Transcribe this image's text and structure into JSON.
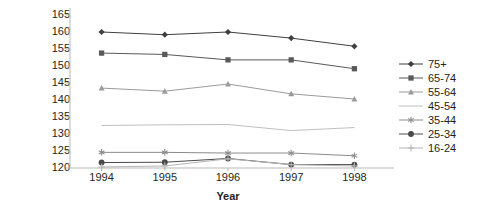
{
  "chart_data": {
    "type": "line",
    "title": "",
    "xlabel": "Year",
    "ylabel": "Systolic BP",
    "x": [
      1994,
      1995,
      1996,
      1997,
      1998
    ],
    "xtick_labels": [
      "1994",
      "1995",
      "1996",
      "1997",
      "1998"
    ],
    "ytick_labels": [
      "120",
      "125",
      "130",
      "135",
      "140",
      "145",
      "150",
      "155",
      "160",
      "165"
    ],
    "ylim": [
      120,
      165
    ],
    "ytick_step": 5,
    "grid": false,
    "legend_position": "right",
    "series": [
      {
        "name": "75+",
        "marker": "diamond",
        "color": "#3f3f3f",
        "values": [
          160.0,
          159.2,
          160.0,
          158.2,
          155.8
        ]
      },
      {
        "name": "65-74",
        "marker": "square",
        "color": "#595959",
        "values": [
          153.8,
          153.4,
          151.8,
          151.8,
          149.2
        ]
      },
      {
        "name": "55-64",
        "marker": "triangle",
        "color": "#9a9a9a",
        "values": [
          143.5,
          142.6,
          144.7,
          141.8,
          140.3
        ]
      },
      {
        "name": "45-54",
        "marker": "none",
        "color": "#c0c0c0",
        "values": [
          132.5,
          132.7,
          132.8,
          131.0,
          131.9
        ]
      },
      {
        "name": "35-44",
        "marker": "asterisk",
        "color": "#8c8c8c",
        "values": [
          124.6,
          124.6,
          124.4,
          124.4,
          123.6
        ]
      },
      {
        "name": "25-34",
        "marker": "circle",
        "color": "#4a4a4a",
        "values": [
          121.6,
          121.7,
          122.8,
          121.0,
          121.0
        ]
      },
      {
        "name": "16-24",
        "marker": "plus",
        "color": "#b5b5b5",
        "values": [
          120.3,
          120.6,
          122.7,
          121.0,
          120.6
        ]
      }
    ]
  }
}
